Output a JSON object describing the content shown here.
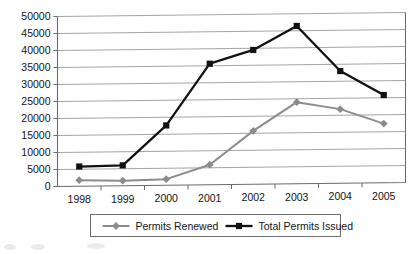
{
  "chart_data": {
    "type": "line",
    "title": "",
    "subtitle": "",
    "xlabel": "",
    "ylabel": "",
    "categories": [
      "1998",
      "1999",
      "2000",
      "2001",
      "2002",
      "2003",
      "2004",
      "2005"
    ],
    "ylim": [
      0,
      50000
    ],
    "ytick_step": 5000,
    "yticks": [
      "0",
      "5000",
      "10000",
      "15000",
      "20000",
      "25000",
      "30000",
      "35000",
      "40000",
      "45000",
      "50000"
    ],
    "grid": "horizontal",
    "legend_position": "bottom",
    "series": [
      {
        "name": "Permits Renewed",
        "color": "#8c8c8c",
        "marker": "diamond",
        "values": [
          1800,
          1500,
          1800,
          5900,
          15700,
          24000,
          21800,
          17400
        ]
      },
      {
        "name": "Total Permits Issued",
        "color": "#111111",
        "marker": "square",
        "values": [
          5800,
          6000,
          17600,
          35600,
          39500,
          46400,
          33000,
          25800
        ]
      }
    ]
  },
  "legend": {
    "items": [
      {
        "label": "Permits Renewed",
        "color": "#8c8c8c",
        "marker": "diamond"
      },
      {
        "label": "Total Permits Issued",
        "color": "#111111",
        "marker": "square"
      }
    ]
  },
  "axes": {
    "y_labels": [
      "50000",
      "45000",
      "40000",
      "35000",
      "30000",
      "25000",
      "20000",
      "15000",
      "10000",
      "5000",
      "0"
    ],
    "x_labels": [
      "1998",
      "1999",
      "2000",
      "2001",
      "2002",
      "2003",
      "2004",
      "2005"
    ]
  }
}
